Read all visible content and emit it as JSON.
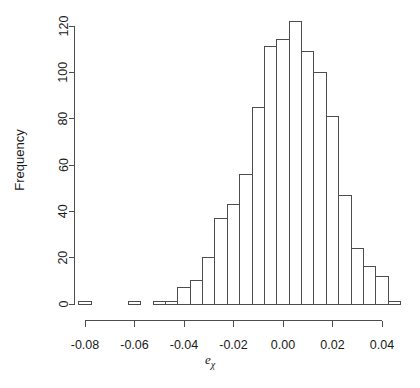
{
  "chart_data": {
    "type": "bar",
    "title": "",
    "xlabel": "e_chi",
    "xlabel_base": "e",
    "xlabel_sub": "χ",
    "ylabel": "Frequency",
    "grid": false,
    "legend": null,
    "xlim": [
      -0.0875,
      0.0505
    ],
    "ylim": [
      0,
      124
    ],
    "xticks": [
      -0.08,
      -0.06,
      -0.04,
      -0.02,
      0.0,
      0.02,
      0.04
    ],
    "xtick_labels": [
      "-0.08",
      "-0.06",
      "-0.04",
      "-0.02",
      "0.00",
      "0.02",
      "0.04"
    ],
    "yticks": [
      0,
      20,
      40,
      60,
      80,
      100,
      120
    ],
    "ytick_labels": [
      "0",
      "20",
      "40",
      "60",
      "80",
      "100",
      "120"
    ],
    "bin_width": 0.005,
    "bin_starts": [
      -0.0825,
      -0.0775,
      -0.0725,
      -0.0675,
      -0.0625,
      -0.0575,
      -0.0525,
      -0.0475,
      -0.0425,
      -0.0375,
      -0.0325,
      -0.0275,
      -0.0225,
      -0.0175,
      -0.0125,
      -0.0075,
      -0.0025,
      0.0025,
      0.0075,
      0.0125,
      0.0175,
      0.0225,
      0.0275,
      0.0325,
      0.0375,
      0.0425
    ],
    "values": [
      1,
      0,
      0,
      0,
      1,
      0,
      1,
      1,
      7,
      10,
      20,
      37,
      43,
      56,
      85,
      111,
      114,
      122,
      109,
      100,
      81,
      47,
      24,
      16,
      12,
      1
    ],
    "categories": [
      "-0.0825",
      "-0.0775",
      "-0.0725",
      "-0.0675",
      "-0.0625",
      "-0.0575",
      "-0.0525",
      "-0.0475",
      "-0.0425",
      "-0.0375",
      "-0.0325",
      "-0.0275",
      "-0.0225",
      "-0.0175",
      "-0.0125",
      "-0.0075",
      "-0.0025",
      "0.0025",
      "0.0075",
      "0.0125",
      "0.0175",
      "0.0225",
      "0.0275",
      "0.0325",
      "0.0375",
      "0.0425"
    ],
    "colors": {
      "bar_fill": "#ffffff",
      "bar_stroke": "#4d4d4d",
      "axis": "#4d4d4d",
      "text": "#1a1a1a",
      "background": "#ffffff"
    }
  }
}
